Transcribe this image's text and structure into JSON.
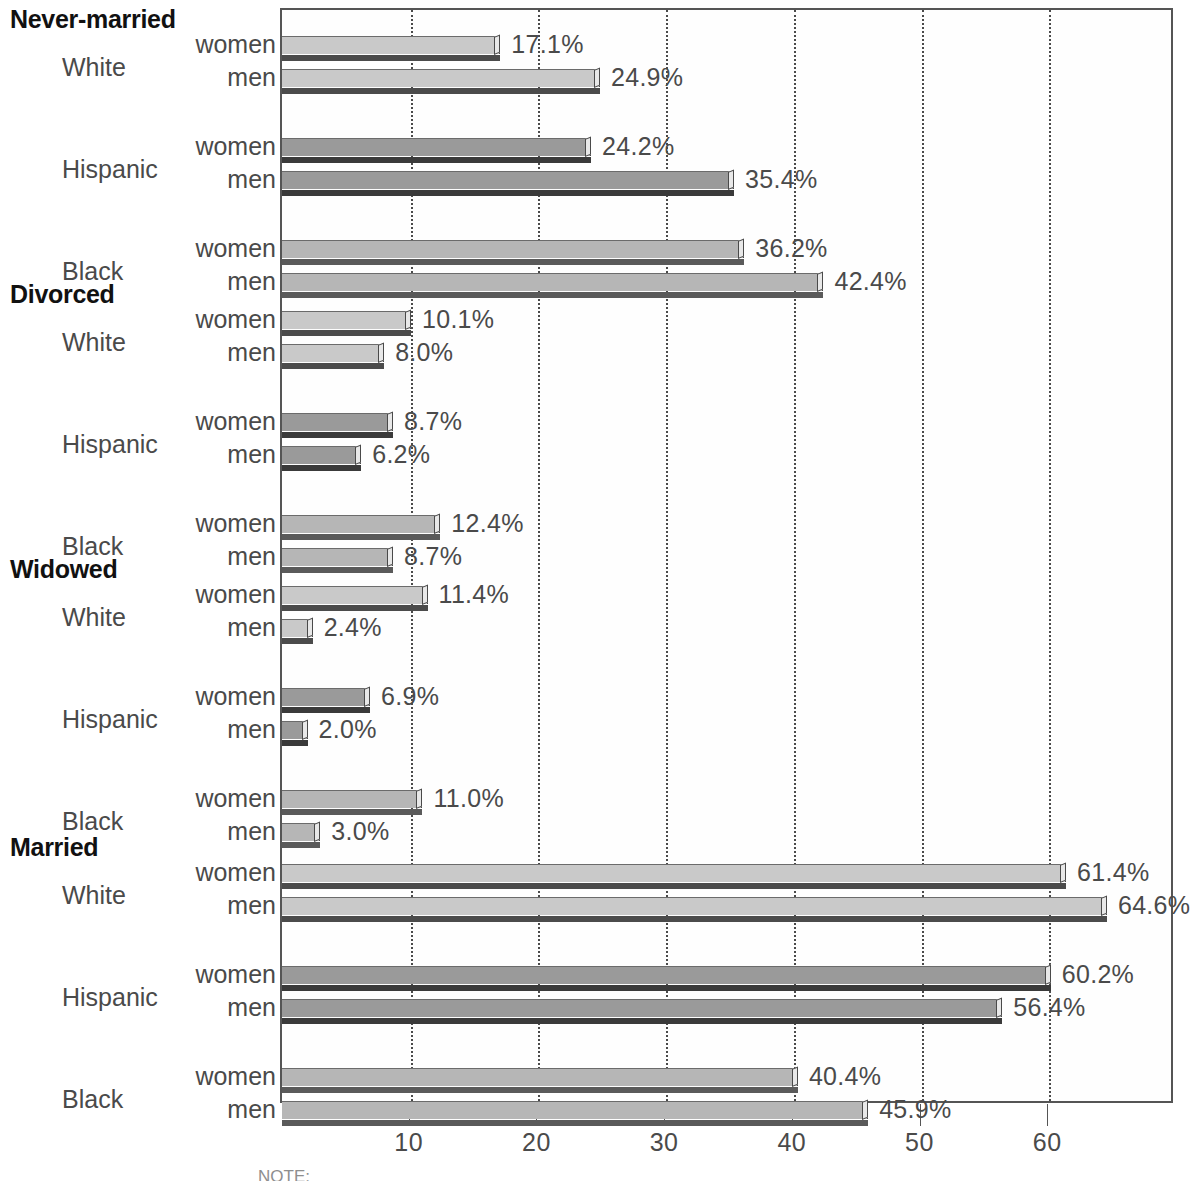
{
  "chart_data": {
    "type": "bar",
    "orientation": "horizontal",
    "title": "",
    "xlabel": "",
    "ylabel": "",
    "xlim": [
      0,
      70
    ],
    "grid": true,
    "grid_axis": "x",
    "legend": "none",
    "xticks": [
      10,
      20,
      30,
      40,
      50,
      60
    ],
    "xtick_labels": [
      "10",
      "20",
      "30",
      "40",
      "50",
      "60"
    ],
    "value_suffix": "%",
    "series_names": [
      "women",
      "men"
    ],
    "categories": [
      "White",
      "Hispanic",
      "Black"
    ],
    "panels": [
      {
        "title": "Never-married",
        "rows": [
          {
            "category": "White",
            "sex": "women",
            "value": 17.1,
            "label": "17.1%"
          },
          {
            "category": "White",
            "sex": "men",
            "value": 24.9,
            "label": "24.9%"
          },
          {
            "category": "Hispanic",
            "sex": "women",
            "value": 24.2,
            "label": "24.2%"
          },
          {
            "category": "Hispanic",
            "sex": "men",
            "value": 35.4,
            "label": "35.4%"
          },
          {
            "category": "Black",
            "sex": "women",
            "value": 36.2,
            "label": "36.2%"
          },
          {
            "category": "Black",
            "sex": "men",
            "value": 42.4,
            "label": "42.4%"
          }
        ]
      },
      {
        "title": "Divorced",
        "rows": [
          {
            "category": "White",
            "sex": "women",
            "value": 10.1,
            "label": "10.1%"
          },
          {
            "category": "White",
            "sex": "men",
            "value": 8.0,
            "label": "8.0%"
          },
          {
            "category": "Hispanic",
            "sex": "women",
            "value": 8.7,
            "label": "8.7%"
          },
          {
            "category": "Hispanic",
            "sex": "men",
            "value": 6.2,
            "label": "6.2%"
          },
          {
            "category": "Black",
            "sex": "women",
            "value": 12.4,
            "label": "12.4%"
          },
          {
            "category": "Black",
            "sex": "men",
            "value": 8.7,
            "label": "8.7%"
          }
        ]
      },
      {
        "title": "Widowed",
        "rows": [
          {
            "category": "White",
            "sex": "women",
            "value": 11.4,
            "label": "11.4%"
          },
          {
            "category": "White",
            "sex": "men",
            "value": 2.4,
            "label": "2.4%"
          },
          {
            "category": "Hispanic",
            "sex": "women",
            "value": 6.9,
            "label": "6.9%"
          },
          {
            "category": "Hispanic",
            "sex": "men",
            "value": 2.0,
            "label": "2.0%"
          },
          {
            "category": "Black",
            "sex": "women",
            "value": 11.0,
            "label": "11.0%"
          },
          {
            "category": "Black",
            "sex": "men",
            "value": 3.0,
            "label": "3.0%"
          }
        ]
      },
      {
        "title": "Married",
        "rows": [
          {
            "category": "White",
            "sex": "women",
            "value": 61.4,
            "label": "61.4%"
          },
          {
            "category": "White",
            "sex": "men",
            "value": 64.6,
            "label": "64.6%"
          },
          {
            "category": "Hispanic",
            "sex": "women",
            "value": 60.2,
            "label": "60.2%"
          },
          {
            "category": "Hispanic",
            "sex": "men",
            "value": 56.4,
            "label": "56.4%"
          },
          {
            "category": "Black",
            "sex": "women",
            "value": 40.4,
            "label": "40.4%"
          },
          {
            "category": "Black",
            "sex": "men",
            "value": 45.9,
            "label": "45.9%"
          }
        ]
      }
    ],
    "colors": {
      "White": "#c9c9c9",
      "Hispanic": "#9a9a9a",
      "Black": "#b6b6b6",
      "frame": "#555555",
      "grid": "#4a4a4a",
      "text": "#4a4a4a"
    }
  },
  "footnote": {
    "text": "NOTE:"
  }
}
